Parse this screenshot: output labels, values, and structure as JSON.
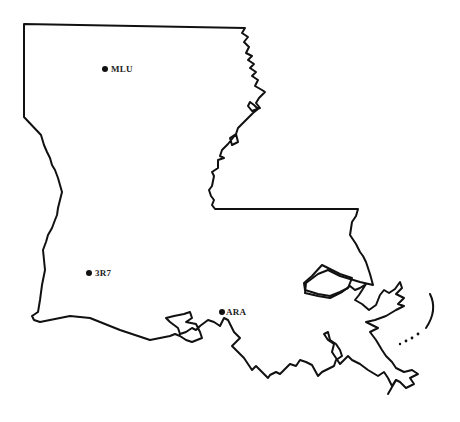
{
  "map": {
    "region": "Louisiana",
    "outline_color": "#111111",
    "background": "#ffffff"
  },
  "markers": [
    {
      "label": "MLU",
      "x": 106,
      "y": 69
    },
    {
      "label": "3R7",
      "x": 90,
      "y": 273
    },
    {
      "label": "ARA",
      "x": 222,
      "y": 312
    }
  ]
}
